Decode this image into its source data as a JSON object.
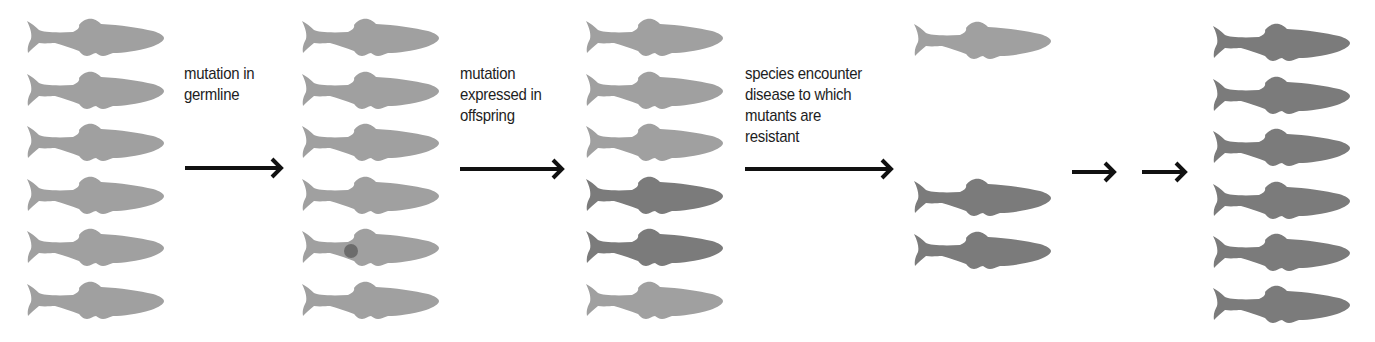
{
  "colors": {
    "normal_fish": "#a0a0a0",
    "mutant_fish": "#7b7b7b",
    "mutation_dot": "#6c6c6c",
    "arrow": "#111111",
    "text": "#1e1e1e",
    "background": "#ffffff"
  },
  "stages": [
    {
      "name": "original-population",
      "x": 25,
      "fish": [
        {
          "y": 17,
          "type": "normal"
        },
        {
          "y": 70,
          "type": "normal"
        },
        {
          "y": 122,
          "type": "normal"
        },
        {
          "y": 175,
          "type": "normal"
        },
        {
          "y": 227,
          "type": "normal"
        },
        {
          "y": 280,
          "type": "normal"
        }
      ]
    },
    {
      "name": "population-with-germline-mutation",
      "x": 300,
      "fish": [
        {
          "y": 17,
          "type": "normal"
        },
        {
          "y": 70,
          "type": "normal"
        },
        {
          "y": 122,
          "type": "normal"
        },
        {
          "y": 175,
          "type": "normal"
        },
        {
          "y": 227,
          "type": "normal",
          "mutation_dot": true
        },
        {
          "y": 280,
          "type": "normal"
        }
      ]
    },
    {
      "name": "offspring-population",
      "x": 584,
      "fish": [
        {
          "y": 17,
          "type": "normal"
        },
        {
          "y": 70,
          "type": "normal"
        },
        {
          "y": 122,
          "type": "normal"
        },
        {
          "y": 175,
          "type": "mutant"
        },
        {
          "y": 227,
          "type": "mutant"
        },
        {
          "y": 280,
          "type": "normal"
        }
      ]
    },
    {
      "name": "surviving-population",
      "x": 912,
      "fish": [
        {
          "y": 20,
          "type": "normal"
        },
        {
          "y": 177,
          "type": "mutant"
        },
        {
          "y": 230,
          "type": "mutant"
        }
      ]
    },
    {
      "name": "resistant-population",
      "x": 1211,
      "fish": [
        {
          "y": 22,
          "type": "mutant"
        },
        {
          "y": 75,
          "type": "mutant"
        },
        {
          "y": 127,
          "type": "mutant"
        },
        {
          "y": 180,
          "type": "mutant"
        },
        {
          "y": 232,
          "type": "mutant"
        },
        {
          "y": 284,
          "type": "mutant"
        }
      ]
    }
  ],
  "transitions": [
    {
      "label_lines": [
        "mutation in",
        "germline"
      ],
      "label_x": 184,
      "label_y": 63,
      "arrow_x1": 185,
      "arrow_x2": 283,
      "arrow_y": 168
    },
    {
      "label_lines": [
        "mutation",
        "expressed in",
        "offspring"
      ],
      "label_x": 460,
      "label_y": 63,
      "arrow_x1": 460,
      "arrow_x2": 564,
      "arrow_y": 169
    },
    {
      "label_lines": [
        "species encounter",
        "disease to which",
        "mutants are",
        "resistant"
      ],
      "label_x": 745,
      "label_y": 63,
      "arrow_x1": 745,
      "arrow_x2": 893,
      "arrow_y": 169
    },
    {
      "label_lines": [],
      "arrow_x1": 1072,
      "arrow_x2": 1116,
      "arrow_y": 172
    },
    {
      "label_lines": [],
      "arrow_x1": 1142,
      "arrow_x2": 1187,
      "arrow_y": 172
    }
  ],
  "labels": {
    "t1": "mutation in\ngermline",
    "t2": "mutation\nexpressed in\noffspring",
    "t3": "species encounter\ndisease to which\nmutants are\nresistant"
  }
}
